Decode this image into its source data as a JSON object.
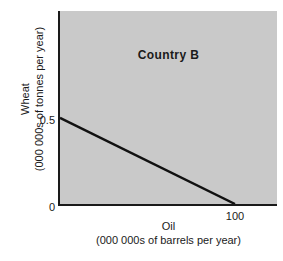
{
  "figure": {
    "bg_color": "#ffffff",
    "text_color": "#1a1a1a"
  },
  "chart_data": {
    "type": "line",
    "title": "Country B",
    "xlabel": "Oil",
    "xlabel_unit": "(000 000s of barrels per year)",
    "ylabel": "Wheat",
    "ylabel_unit": "(000 000s of tonnes per year)",
    "series": [
      {
        "name": "production-possibility-frontier",
        "points": [
          {
            "x": 0,
            "y": 0.5
          },
          {
            "x": 100,
            "y": 0
          }
        ]
      }
    ],
    "x_ticks": [
      {
        "value": 100,
        "label": "100"
      }
    ],
    "y_ticks": [
      {
        "value": 0.5,
        "label": "0.5"
      },
      {
        "value": 0,
        "label": "0"
      }
    ],
    "xlim": [
      0,
      124
    ],
    "ylim": [
      0,
      1.12
    ],
    "grid": false,
    "legend": "none",
    "plot_bg_color": "#c9c9c9",
    "line_color": "#111111",
    "axis_color": "#1a1a1a"
  }
}
